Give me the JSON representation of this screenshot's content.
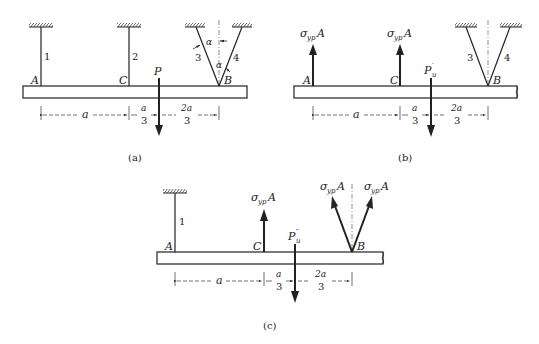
{
  "panels": {
    "a": {
      "caption": "(a)",
      "points": {
        "A": "A",
        "C": "C",
        "B": "B"
      },
      "load": "P",
      "bars": {
        "bar1": "1",
        "bar2": "2",
        "bar3": "3",
        "bar4": "4"
      },
      "angle": "α",
      "dims": {
        "d1": "a",
        "d2_num": "a",
        "d2_den": "3",
        "d3_num": "2a",
        "d3_den": "3"
      }
    },
    "b": {
      "caption": "(b)",
      "points": {
        "A": "A",
        "C": "C",
        "B": "B"
      },
      "load_main": "P",
      "load_sub": "u",
      "load_prime": "′",
      "force_A": {
        "sigma": "σ",
        "sub": "yp",
        "area": "A"
      },
      "force_C": {
        "sigma": "σ",
        "sub": "yp",
        "area": "A"
      },
      "bars": {
        "bar3": "3",
        "bar4": "4"
      },
      "dims": {
        "d1": "a",
        "d2_num": "a",
        "d2_den": "3",
        "d3_num": "2a",
        "d3_den": "3"
      }
    },
    "c": {
      "caption": "(c)",
      "points": {
        "A": "A",
        "C": "C",
        "B": "B"
      },
      "load_main": "P",
      "load_sub": "u",
      "load_prime": "″",
      "bars": {
        "bar1": "1"
      },
      "force_C": {
        "sigma": "σ",
        "sub": "yp",
        "area": "A"
      },
      "force_B3": {
        "sigma": "σ",
        "sub": "yp",
        "area": "A"
      },
      "force_B4": {
        "sigma": "σ",
        "sub": "yp",
        "area": "A"
      },
      "dims": {
        "d1": "a",
        "d2_num": "a",
        "d2_den": "3",
        "d3_num": "2a",
        "d3_den": "3"
      }
    }
  },
  "colors": {
    "ink": "#222222",
    "background": "#ffffff"
  }
}
